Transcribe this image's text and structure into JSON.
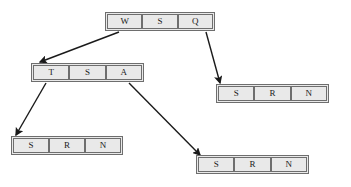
{
  "diagram": {
    "type": "tree-of-arrays",
    "background_color": "#ffffff",
    "node_fill_color": "#e9e9e9",
    "node_border_color": "#6e6e6e",
    "edge_color": "#1a1a1a",
    "nodes": [
      {
        "id": "root",
        "name": "root-array-node",
        "cells": [
          "W",
          "S",
          "Q"
        ],
        "x": 105,
        "y": 12,
        "width": 110,
        "height": 19,
        "cell_width": 36
      },
      {
        "id": "left-child",
        "name": "left-child-array-node",
        "cells": [
          "T",
          "S",
          "A"
        ],
        "x": 31,
        "y": 63,
        "width": 113,
        "height": 19,
        "cell_width": 37
      },
      {
        "id": "right-leaf",
        "name": "right-leaf-array-node",
        "cells": [
          "S",
          "R",
          "N"
        ],
        "x": 216,
        "y": 84,
        "width": 113,
        "height": 19,
        "cell_width": 37
      },
      {
        "id": "bottom-left-leaf",
        "name": "bottom-left-leaf-array-node",
        "cells": [
          "S",
          "R",
          "N"
        ],
        "x": 11,
        "y": 136,
        "width": 112,
        "height": 19,
        "cell_width": 37
      },
      {
        "id": "bottom-right-leaf",
        "name": "bottom-right-leaf-array-node",
        "cells": [
          "S",
          "R",
          "N"
        ],
        "x": 196,
        "y": 155,
        "width": 113,
        "height": 19,
        "cell_width": 37
      }
    ],
    "edges": [
      {
        "id": "edge-w-to-left-child",
        "name": "arrow-root-w-to-left-child",
        "from_node": "root",
        "from_cell": "W",
        "to_node": "left-child",
        "x1": 119,
        "y1": 32,
        "x2": 40,
        "y2": 62
      },
      {
        "id": "edge-q-to-right-leaf",
        "name": "arrow-root-q-to-right-leaf",
        "from_node": "root",
        "from_cell": "Q",
        "to_node": "right-leaf",
        "x1": 206,
        "y1": 32,
        "x2": 220,
        "y2": 83
      },
      {
        "id": "edge-t-to-bottom-left-leaf",
        "name": "arrow-left-child-t-to-bottom-left-leaf",
        "from_node": "left-child",
        "from_cell": "T",
        "to_node": "bottom-left-leaf",
        "x1": 46,
        "y1": 83,
        "x2": 16,
        "y2": 135
      },
      {
        "id": "edge-a-to-bottom-right-leaf",
        "name": "arrow-left-child-a-to-bottom-right-leaf",
        "from_node": "left-child",
        "from_cell": "A",
        "to_node": "bottom-right-leaf",
        "x1": 129,
        "y1": 83,
        "x2": 200,
        "y2": 155
      }
    ]
  }
}
